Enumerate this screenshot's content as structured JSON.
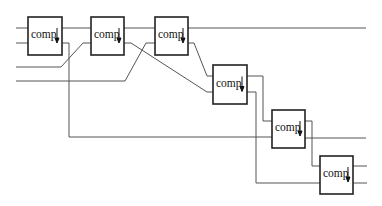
{
  "diagram": {
    "node_label": "comp",
    "node_icon": "down-arrow-icon",
    "colors": {
      "wire": "#555555",
      "box_border": "#222222",
      "text": "#111111",
      "background": "#ffffff"
    },
    "nodes": [
      {
        "id": "comp1",
        "label": "comp",
        "x": 28,
        "y": 17,
        "w": 34,
        "h": 38
      },
      {
        "id": "comp2",
        "label": "comp",
        "x": 91,
        "y": 17,
        "w": 33,
        "h": 38
      },
      {
        "id": "comp3",
        "label": "comp",
        "x": 155,
        "y": 17,
        "w": 33,
        "h": 38
      },
      {
        "id": "comp4",
        "label": "comp",
        "x": 213,
        "y": 65,
        "w": 34,
        "h": 39
      },
      {
        "id": "comp5",
        "label": "comp",
        "x": 272,
        "y": 110,
        "w": 33,
        "h": 38
      },
      {
        "id": "comp6",
        "label": "comp",
        "x": 320,
        "y": 156,
        "w": 33,
        "h": 38
      }
    ],
    "wires": [
      {
        "id": "w-top",
        "points": "16,28 366,28"
      },
      {
        "id": "w-in2",
        "points": "16,43 28,43"
      },
      {
        "id": "w-c1-low",
        "points": "62,43 69,43 69,137 272,137"
      },
      {
        "id": "w-in3",
        "points": "16,67 61,67 83,43 91,43"
      },
      {
        "id": "w-in4",
        "points": "16,81 125,81 146,43 155,43"
      },
      {
        "id": "w-c2-low",
        "points": "124,43 131,43 207,92 213,92"
      },
      {
        "id": "w-c3-low",
        "points": "188,43 194,43 207,76 213,76"
      },
      {
        "id": "w-c4-top",
        "points": "247,76 263,76 263,121 272,121"
      },
      {
        "id": "w-c4-low",
        "points": "247,92 256,92 256,183 320,183"
      },
      {
        "id": "w-c5-top",
        "points": "305,121 312,121 312,166 320,166"
      },
      {
        "id": "w-c5-low",
        "points": "305,138 366,138"
      },
      {
        "id": "w-c6-top",
        "points": "353,166 367,166"
      },
      {
        "id": "w-c6-low",
        "points": "353,183 367,183"
      }
    ]
  }
}
